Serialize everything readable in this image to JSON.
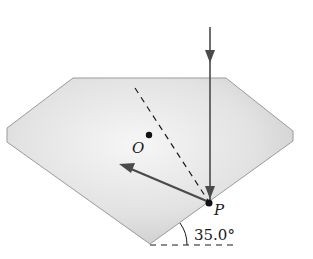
{
  "diagram": {
    "labels": {
      "center": "O",
      "point": "P",
      "angle": "35.0°"
    },
    "colors": {
      "prism_fill_light": "#f4f4f4",
      "prism_fill_dark": "#c9c9c9",
      "prism_edge": "#9a9a9a",
      "ray": "#4a4a4a",
      "ink": "#1a1a1a"
    }
  }
}
